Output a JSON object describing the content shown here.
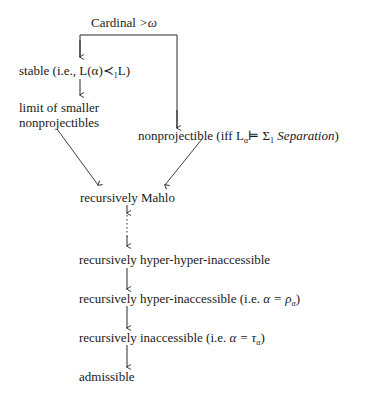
{
  "diagram": {
    "type": "implication-hierarchy",
    "nodes": {
      "cardinal": {
        "label": "Cardinal",
        "math": ">ω"
      },
      "stable": {
        "label": "stable (i.e.,",
        "math": "L(α)≺",
        "sub": "1",
        "tail": "L)"
      },
      "limit": {
        "line1": "limit of smaller",
        "line2": "nonprojectibles"
      },
      "nonprojectible": {
        "label": "nonprojectible (iff",
        "math_l": "L",
        "math_sub": "α",
        "math_rel": "⊨ Σ",
        "sigma_sub": "1",
        "italic": "Separation",
        "tail": ")"
      },
      "mahlo": {
        "label": "recursively Mahlo"
      },
      "hyperhyper": {
        "label": "recursively hyper-hyper-inaccessible"
      },
      "hyper": {
        "label": "recursively hyper-inaccessible (i.e.",
        "math": "α = ρ",
        "sub": "α",
        "tail": ")"
      },
      "inaccessible": {
        "label": "recursively inaccessible (i.e.",
        "math": "α = τ",
        "sub": "α",
        "tail": ")"
      },
      "admissible": {
        "label": "admissible"
      }
    },
    "edges": [
      {
        "from": "cardinal",
        "to": "stable",
        "style": "solid"
      },
      {
        "from": "cardinal",
        "to": "nonprojectible",
        "style": "solid"
      },
      {
        "from": "stable",
        "to": "limit",
        "style": "solid"
      },
      {
        "from": "limit",
        "to": "mahlo",
        "style": "solid"
      },
      {
        "from": "nonprojectible",
        "to": "mahlo",
        "style": "solid"
      },
      {
        "from": "mahlo",
        "to": "hyperhyper",
        "style": "dotted"
      },
      {
        "from": "hyperhyper",
        "to": "hyper",
        "style": "solid"
      },
      {
        "from": "hyper",
        "to": "inaccessible",
        "style": "solid"
      },
      {
        "from": "inaccessible",
        "to": "admissible",
        "style": "solid"
      }
    ],
    "colors": {
      "ink": "#1a1a1a",
      "background": "#ffffff"
    }
  }
}
